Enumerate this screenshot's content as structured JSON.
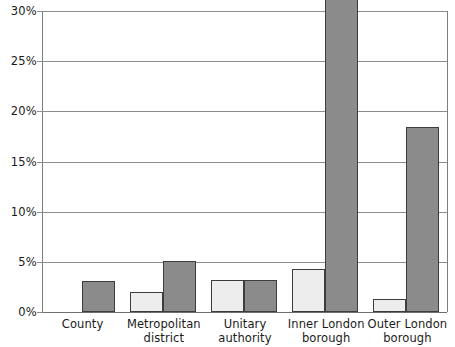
{
  "chart_data": {
    "type": "bar",
    "title": "",
    "subtitle": "",
    "xlabel": "",
    "ylabel": "",
    "categories": [
      "County",
      "Metropolitan district",
      "Unitary authority",
      "Inner London borough",
      "Outer London borough"
    ],
    "category_lines": [
      [
        "County",
        ""
      ],
      [
        "Metropolitan",
        "district"
      ],
      [
        "Unitary",
        "authority"
      ],
      [
        "Inner London",
        "borough"
      ],
      [
        "Outer London",
        "borough"
      ]
    ],
    "series": [
      {
        "name": "series-1",
        "color": "#ededed",
        "values": [
          0,
          2.0,
          3.2,
          4.3,
          1.3
        ]
      },
      {
        "name": "series-2",
        "color": "#8b8b8b",
        "values": [
          3.1,
          5.1,
          3.2,
          34.0,
          18.4
        ]
      }
    ],
    "ylim": [
      0,
      30
    ],
    "y_ticks": [
      0,
      5,
      10,
      15,
      20,
      25,
      30
    ],
    "y_tick_labels": [
      "0%",
      "5%",
      "10%",
      "15%",
      "20%",
      "25%",
      "30%"
    ],
    "y_clipped_note": "inner-london-borough-series-2-exceeds-axis-maximum",
    "grid": true,
    "legend": "none",
    "axis_color": "#8d8d8d",
    "bar_border_color": "#3d3d3d",
    "background": "#ffffff"
  }
}
